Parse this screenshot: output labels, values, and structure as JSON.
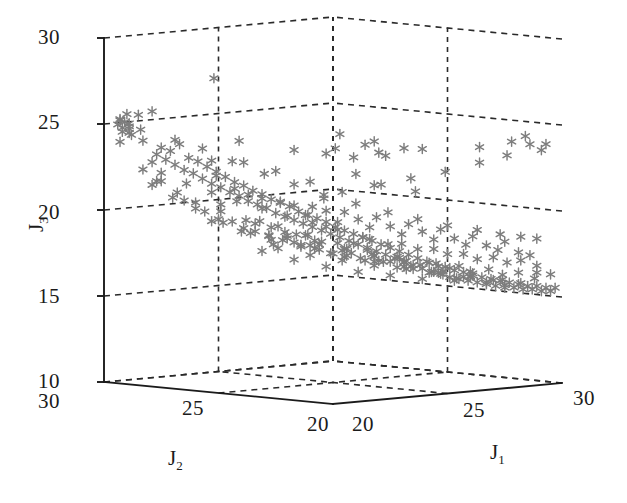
{
  "chart_data": {
    "type": "scatter",
    "dimensions": "3d",
    "title": "",
    "xlabel": "J_1",
    "ylabel": "J_2",
    "zlabel": "J_3",
    "axes": {
      "J1": {
        "label": "J1",
        "ticks": [
          20,
          25,
          30
        ],
        "tick_labels": [
          "20",
          "25",
          "30"
        ],
        "min": 20,
        "max": 30
      },
      "J2": {
        "label": "J2",
        "ticks": [
          30,
          25,
          20
        ],
        "tick_labels": [
          "30",
          "25",
          "20"
        ],
        "min": 20,
        "max": 30
      },
      "J3": {
        "label": "J3",
        "ticks": [
          10,
          15,
          20,
          25,
          30
        ],
        "tick_labels": [
          "10",
          "15",
          "20",
          "25",
          "30"
        ],
        "min": 10,
        "max": 30
      }
    },
    "grid": true,
    "legend": false,
    "marker": {
      "style": "asterisk",
      "color": "#7d7d7d",
      "size": 8
    },
    "points": [
      [
        20.2,
        29.6,
        25.0
      ],
      [
        20.3,
        29.5,
        24.8
      ],
      [
        20.4,
        29.7,
        25.2
      ],
      [
        20.2,
        29.4,
        24.6
      ],
      [
        20.5,
        29.6,
        25.1
      ],
      [
        20.4,
        29.3,
        24.9
      ],
      [
        20.6,
        29.5,
        24.7
      ],
      [
        20.3,
        29.6,
        25.3
      ],
      [
        20.5,
        29.4,
        24.5
      ],
      [
        20.7,
        29.6,
        25.0
      ],
      [
        21.2,
        29.1,
        25.7
      ],
      [
        21.0,
        29.3,
        24.0
      ],
      [
        21.4,
        28.9,
        23.6
      ],
      [
        21.3,
        29.0,
        23.2
      ],
      [
        21.6,
        28.7,
        23.4
      ],
      [
        21.5,
        28.8,
        22.9
      ],
      [
        21.8,
        28.5,
        23.8
      ],
      [
        21.7,
        28.6,
        22.6
      ],
      [
        22.0,
        28.3,
        23.0
      ],
      [
        21.9,
        28.4,
        22.3
      ],
      [
        22.2,
        28.1,
        22.8
      ],
      [
        22.1,
        28.2,
        22.1
      ],
      [
        22.4,
        27.9,
        22.5
      ],
      [
        22.3,
        28.0,
        21.8
      ],
      [
        22.6,
        27.7,
        22.2
      ],
      [
        22.5,
        27.8,
        21.5
      ],
      [
        22.8,
        27.5,
        21.9
      ],
      [
        22.7,
        27.6,
        21.3
      ],
      [
        23.0,
        27.3,
        21.6
      ],
      [
        22.9,
        27.4,
        21.0
      ],
      [
        23.2,
        27.1,
        21.4
      ],
      [
        23.1,
        27.2,
        20.8
      ],
      [
        23.4,
        26.9,
        21.1
      ],
      [
        23.3,
        27.0,
        20.5
      ],
      [
        23.6,
        26.7,
        20.9
      ],
      [
        23.5,
        26.8,
        20.3
      ],
      [
        23.8,
        26.5,
        20.6
      ],
      [
        23.7,
        26.6,
        20.1
      ],
      [
        24.0,
        26.3,
        20.4
      ],
      [
        23.9,
        26.4,
        19.8
      ],
      [
        24.2,
        26.1,
        20.2
      ],
      [
        24.1,
        26.2,
        19.6
      ],
      [
        24.4,
        25.9,
        19.9
      ],
      [
        24.3,
        26.0,
        19.4
      ],
      [
        24.6,
        25.7,
        19.7
      ],
      [
        24.5,
        25.8,
        19.2
      ],
      [
        24.8,
        25.5,
        19.5
      ],
      [
        24.7,
        25.6,
        19.0
      ],
      [
        25.0,
        25.3,
        19.3
      ],
      [
        24.9,
        25.4,
        18.8
      ],
      [
        25.2,
        25.1,
        19.0
      ],
      [
        25.1,
        25.2,
        18.6
      ],
      [
        25.4,
        24.9,
        18.8
      ],
      [
        25.3,
        25.0,
        18.4
      ],
      [
        25.6,
        24.7,
        18.6
      ],
      [
        25.5,
        24.8,
        18.2
      ],
      [
        25.8,
        24.5,
        18.4
      ],
      [
        25.7,
        24.6,
        18.0
      ],
      [
        26.0,
        24.3,
        18.2
      ],
      [
        25.9,
        24.4,
        17.8
      ],
      [
        26.2,
        24.1,
        18.0
      ],
      [
        26.1,
        24.2,
        17.6
      ],
      [
        26.4,
        23.9,
        17.8
      ],
      [
        26.3,
        24.0,
        17.4
      ],
      [
        26.6,
        23.7,
        17.6
      ],
      [
        26.5,
        23.8,
        17.2
      ],
      [
        26.8,
        23.5,
        17.4
      ],
      [
        26.7,
        23.6,
        17.0
      ],
      [
        27.0,
        23.3,
        17.2
      ],
      [
        26.9,
        23.4,
        16.8
      ],
      [
        27.2,
        23.1,
        17.0
      ],
      [
        27.1,
        23.2,
        16.6
      ],
      [
        27.4,
        22.9,
        16.9
      ],
      [
        27.3,
        23.0,
        16.4
      ],
      [
        27.6,
        22.7,
        16.7
      ],
      [
        27.5,
        22.8,
        16.3
      ],
      [
        27.8,
        22.5,
        16.5
      ],
      [
        27.7,
        22.6,
        16.1
      ],
      [
        28.0,
        22.3,
        16.4
      ],
      [
        27.9,
        22.4,
        16.0
      ],
      [
        28.2,
        22.1,
        16.2
      ],
      [
        28.1,
        22.2,
        15.9
      ],
      [
        28.4,
        21.9,
        16.1
      ],
      [
        28.3,
        22.0,
        15.8
      ],
      [
        28.6,
        21.7,
        16.0
      ],
      [
        28.5,
        21.8,
        15.7
      ],
      [
        28.8,
        21.5,
        15.9
      ],
      [
        28.7,
        21.6,
        15.6
      ],
      [
        29.0,
        21.3,
        15.8
      ],
      [
        28.9,
        21.4,
        15.5
      ],
      [
        29.2,
        21.1,
        15.7
      ],
      [
        29.1,
        21.2,
        15.5
      ],
      [
        29.4,
        20.9,
        15.6
      ],
      [
        29.3,
        21.0,
        15.4
      ],
      [
        29.6,
        20.7,
        15.6
      ],
      [
        29.5,
        20.8,
        15.4
      ],
      [
        29.8,
        20.5,
        15.5
      ],
      [
        29.7,
        20.6,
        15.3
      ],
      [
        30.0,
        20.3,
        15.5
      ],
      [
        29.9,
        20.4,
        15.3
      ],
      [
        22.3,
        26.4,
        24.2
      ],
      [
        21.9,
        27.1,
        27.8
      ],
      [
        23.4,
        25.1,
        23.7
      ],
      [
        24.1,
        24.4,
        23.5
      ],
      [
        25.3,
        23.0,
        23.4
      ],
      [
        26.1,
        22.2,
        23.8
      ],
      [
        27.4,
        21.0,
        23.9
      ],
      [
        28.2,
        20.4,
        24.2
      ],
      [
        28.8,
        20.2,
        24.0
      ],
      [
        29.3,
        20.2,
        23.6
      ],
      [
        29.6,
        20.3,
        23.9
      ],
      [
        29.0,
        20.6,
        24.4
      ],
      [
        28.5,
        20.9,
        23.3
      ],
      [
        27.8,
        21.4,
        22.9
      ],
      [
        26.9,
        22.0,
        22.4
      ],
      [
        26.2,
        22.8,
        22.0
      ],
      [
        25.4,
        23.6,
        21.6
      ],
      [
        24.7,
        24.3,
        21.2
      ],
      [
        24.0,
        25.0,
        21.8
      ],
      [
        23.3,
        25.8,
        22.4
      ],
      [
        22.6,
        26.5,
        22.9
      ],
      [
        24.9,
        26.1,
        19.6
      ],
      [
        25.6,
        25.4,
        19.2
      ],
      [
        26.3,
        24.7,
        18.9
      ],
      [
        27.0,
        24.0,
        18.5
      ],
      [
        27.7,
        23.3,
        18.2
      ],
      [
        28.4,
        22.6,
        17.9
      ],
      [
        29.1,
        21.9,
        17.6
      ],
      [
        29.8,
        21.2,
        17.3
      ],
      [
        23.6,
        27.3,
        20.8
      ],
      [
        24.3,
        26.6,
        20.4
      ],
      [
        25.0,
        25.9,
        20.1
      ],
      [
        25.7,
        25.2,
        19.8
      ],
      [
        26.4,
        24.5,
        19.5
      ],
      [
        27.1,
        23.8,
        19.1
      ],
      [
        27.8,
        23.1,
        18.8
      ],
      [
        28.5,
        22.4,
        18.4
      ],
      [
        29.2,
        21.7,
        18.1
      ],
      [
        22.9,
        28.0,
        21.9
      ],
      [
        23.1,
        27.4,
        21.2
      ],
      [
        23.8,
        26.9,
        20.6
      ],
      [
        24.5,
        26.2,
        20.2
      ],
      [
        25.2,
        25.5,
        19.9
      ],
      [
        25.9,
        24.8,
        19.4
      ],
      [
        26.6,
        24.1,
        19.0
      ],
      [
        27.3,
        23.4,
        18.7
      ],
      [
        28.0,
        22.7,
        18.3
      ],
      [
        28.7,
        22.0,
        17.9
      ],
      [
        29.4,
        21.3,
        17.5
      ],
      [
        24.4,
        25.4,
        18.0
      ],
      [
        25.1,
        24.7,
        17.7
      ],
      [
        25.8,
        24.0,
        17.4
      ],
      [
        26.5,
        23.3,
        17.1
      ],
      [
        27.2,
        22.6,
        16.8
      ],
      [
        27.9,
        21.9,
        16.5
      ],
      [
        28.6,
        21.2,
        16.3
      ],
      [
        29.3,
        20.5,
        16.1
      ],
      [
        23.9,
        25.9,
        18.4
      ],
      [
        23.2,
        26.6,
        18.8
      ],
      [
        22.5,
        27.3,
        19.3
      ],
      [
        26.0,
        25.6,
        16.9
      ],
      [
        26.7,
        24.9,
        16.6
      ],
      [
        27.4,
        24.2,
        16.4
      ],
      [
        28.1,
        23.5,
        16.2
      ],
      [
        28.8,
        22.8,
        16.0
      ],
      [
        29.5,
        22.1,
        15.8
      ],
      [
        25.3,
        26.3,
        17.2
      ],
      [
        24.6,
        27.0,
        17.6
      ],
      [
        27.6,
        25.1,
        15.9
      ],
      [
        28.3,
        24.4,
        15.7
      ],
      [
        29.0,
        23.7,
        15.6
      ],
      [
        29.7,
        23.0,
        15.5
      ],
      [
        26.9,
        25.8,
        16.1
      ],
      [
        26.2,
        26.5,
        16.4
      ],
      [
        25.5,
        27.2,
        16.8
      ],
      [
        24.8,
        27.9,
        17.3
      ],
      [
        29.9,
        22.4,
        15.4
      ],
      [
        29.4,
        23.4,
        15.8
      ],
      [
        28.9,
        24.1,
        16.1
      ],
      [
        28.2,
        24.8,
        16.4
      ],
      [
        27.5,
        25.5,
        16.7
      ],
      [
        26.8,
        26.2,
        17.0
      ],
      [
        26.1,
        26.9,
        17.4
      ],
      [
        25.4,
        27.6,
        17.9
      ],
      [
        24.7,
        28.3,
        18.3
      ],
      [
        29.6,
        24.2,
        15.6
      ],
      [
        29.1,
        24.9,
        15.9
      ],
      [
        28.4,
        25.6,
        16.2
      ],
      [
        27.7,
        26.3,
        16.6
      ],
      [
        27.0,
        27.0,
        17.0
      ],
      [
        26.3,
        27.7,
        17.5
      ],
      [
        25.6,
        28.4,
        18.0
      ],
      [
        29.8,
        25.0,
        15.7
      ],
      [
        29.2,
        25.7,
        16.0
      ],
      [
        28.6,
        26.4,
        16.4
      ],
      [
        27.9,
        27.1,
        16.9
      ],
      [
        27.2,
        27.8,
        17.4
      ],
      [
        26.5,
        28.5,
        17.9
      ],
      [
        24.2,
        28.6,
        19.0
      ],
      [
        23.5,
        29.1,
        19.6
      ],
      [
        22.8,
        29.3,
        20.3
      ],
      [
        22.1,
        28.9,
        20.9
      ],
      [
        21.5,
        29.2,
        21.6
      ],
      [
        21.1,
        29.4,
        22.3
      ],
      [
        28.1,
        26.0,
        21.0
      ],
      [
        28.9,
        25.3,
        20.6
      ],
      [
        29.5,
        26.4,
        22.9
      ],
      [
        29.1,
        27.1,
        22.6
      ],
      [
        27.6,
        28.0,
        20.0
      ],
      [
        28.4,
        27.4,
        21.4
      ],
      [
        29.0,
        28.1,
        22.2
      ],
      [
        29.6,
        27.8,
        23.1
      ],
      [
        28.7,
        28.6,
        22.7
      ],
      [
        29.3,
        29.0,
        23.4
      ],
      [
        29.8,
        28.4,
        22.8
      ],
      [
        24.5,
        24.0,
        17.5
      ],
      [
        25.2,
        23.4,
        17.2
      ],
      [
        25.9,
        22.8,
        16.9
      ],
      [
        26.6,
        22.2,
        16.6
      ],
      [
        27.3,
        21.6,
        16.3
      ],
      [
        28.0,
        21.0,
        16.1
      ],
      [
        28.7,
        20.5,
        15.9
      ],
      [
        24.0,
        24.6,
        17.9
      ],
      [
        23.5,
        25.2,
        18.3
      ],
      [
        23.0,
        25.8,
        18.7
      ],
      [
        22.5,
        26.4,
        19.1
      ],
      [
        22.0,
        27.0,
        19.6
      ],
      [
        21.6,
        27.6,
        20.2
      ],
      [
        21.2,
        28.2,
        20.8
      ],
      [
        20.9,
        28.8,
        21.5
      ],
      [
        26.0,
        23.6,
        18.1
      ],
      [
        26.7,
        23.0,
        17.8
      ],
      [
        27.4,
        22.4,
        17.5
      ],
      [
        28.1,
        21.8,
        17.2
      ],
      [
        28.8,
        21.2,
        17.0
      ],
      [
        29.5,
        20.6,
        16.8
      ],
      [
        25.5,
        24.2,
        18.5
      ],
      [
        25.0,
        24.8,
        18.9
      ],
      [
        24.5,
        25.4,
        19.3
      ],
      [
        24.0,
        26.0,
        19.7
      ],
      [
        23.5,
        26.6,
        20.1
      ],
      [
        23.0,
        27.2,
        20.5
      ],
      [
        22.5,
        27.8,
        21.0
      ],
      [
        22.0,
        28.4,
        21.5
      ],
      [
        21.5,
        29.0,
        22.1
      ],
      [
        26.5,
        24.8,
        17.3
      ],
      [
        27.1,
        24.2,
        17.1
      ],
      [
        27.8,
        23.6,
        16.8
      ],
      [
        28.5,
        23.0,
        16.6
      ],
      [
        29.2,
        22.4,
        16.4
      ],
      [
        29.9,
        21.8,
        16.2
      ],
      [
        26.0,
        25.4,
        17.6
      ],
      [
        25.5,
        26.0,
        18.0
      ],
      [
        25.0,
        26.6,
        18.4
      ],
      [
        24.5,
        27.2,
        18.8
      ],
      [
        24.0,
        27.8,
        19.2
      ],
      [
        23.5,
        28.4,
        19.7
      ],
      [
        23.0,
        29.0,
        20.2
      ],
      [
        27.3,
        26.1,
        16.8
      ],
      [
        28.0,
        25.5,
        16.6
      ],
      [
        28.7,
        24.9,
        16.4
      ],
      [
        29.4,
        24.3,
        16.2
      ],
      [
        26.6,
        26.7,
        17.1
      ],
      [
        25.9,
        27.3,
        17.5
      ],
      [
        25.2,
        27.9,
        17.9
      ],
      [
        24.5,
        28.5,
        18.4
      ],
      [
        23.8,
        29.1,
        19.0
      ],
      [
        29.9,
        23.8,
        15.9
      ],
      [
        29.3,
        26.2,
        16.3
      ],
      [
        28.6,
        26.8,
        16.7
      ],
      [
        27.9,
        27.4,
        17.1
      ],
      [
        27.2,
        28.0,
        17.6
      ],
      [
        26.5,
        28.6,
        18.1
      ],
      [
        25.8,
        29.2,
        18.6
      ],
      [
        29.7,
        26.9,
        16.5
      ],
      [
        29.0,
        27.5,
        16.9
      ],
      [
        28.3,
        28.1,
        17.3
      ],
      [
        27.6,
        28.7,
        17.8
      ],
      [
        26.9,
        29.3,
        18.3
      ],
      [
        29.8,
        28.9,
        17.0
      ],
      [
        20.8,
        29.8,
        25.5
      ],
      [
        20.9,
        29.7,
        24.3
      ],
      [
        21.1,
        29.5,
        24.6
      ],
      [
        21.3,
        29.8,
        25.4
      ],
      [
        22.7,
        29.6,
        23.8
      ],
      [
        20.6,
        29.9,
        23.9
      ],
      [
        23.1,
        28.4,
        22.7
      ],
      [
        24.3,
        29.2,
        19.9
      ],
      [
        25.7,
        28.9,
        18.8
      ],
      [
        27.0,
        29.6,
        17.2
      ],
      [
        28.2,
        29.4,
        17.6
      ],
      [
        29.5,
        29.8,
        17.9
      ],
      [
        24.8,
        23.2,
        18.6
      ],
      [
        25.6,
        22.6,
        18.3
      ],
      [
        26.3,
        21.9,
        18.0
      ],
      [
        27.0,
        21.3,
        17.7
      ],
      [
        27.7,
        20.7,
        17.5
      ],
      [
        28.4,
        20.2,
        17.3
      ],
      [
        22.4,
        29.9,
        21.4
      ],
      [
        21.8,
        29.7,
        22.6
      ],
      [
        29.1,
        20.2,
        16.5
      ],
      [
        29.8,
        20.3,
        16.3
      ],
      [
        26.1,
        21.1,
        19.5
      ],
      [
        26.9,
        20.6,
        19.2
      ],
      [
        27.6,
        20.3,
        18.9
      ],
      [
        28.3,
        20.1,
        18.7
      ],
      [
        29.0,
        20.1,
        18.5
      ],
      [
        25.3,
        21.6,
        19.9
      ],
      [
        24.6,
        22.2,
        20.3
      ],
      [
        23.9,
        22.9,
        20.8
      ],
      [
        23.2,
        23.6,
        21.3
      ],
      [
        22.6,
        24.3,
        21.9
      ],
      [
        22.0,
        25.0,
        22.5
      ],
      [
        21.4,
        25.8,
        23.2
      ],
      [
        20.9,
        26.6,
        23.9
      ]
    ]
  },
  "axis_titles": {
    "j1": "J",
    "j1_sub": "1",
    "j2": "J",
    "j2_sub": "2",
    "j3": "J",
    "j3_sub": "3"
  },
  "ticks": {
    "j3": [
      "30",
      "25",
      "20",
      "15",
      "10"
    ],
    "j2": [
      "30",
      "25",
      "20"
    ],
    "j1": [
      "20",
      "25",
      "30"
    ]
  },
  "colors": {
    "marker": "#7d7d7d",
    "axis": "#1b1b1b",
    "grid": "#2a2a2a",
    "background": "#ffffff"
  }
}
